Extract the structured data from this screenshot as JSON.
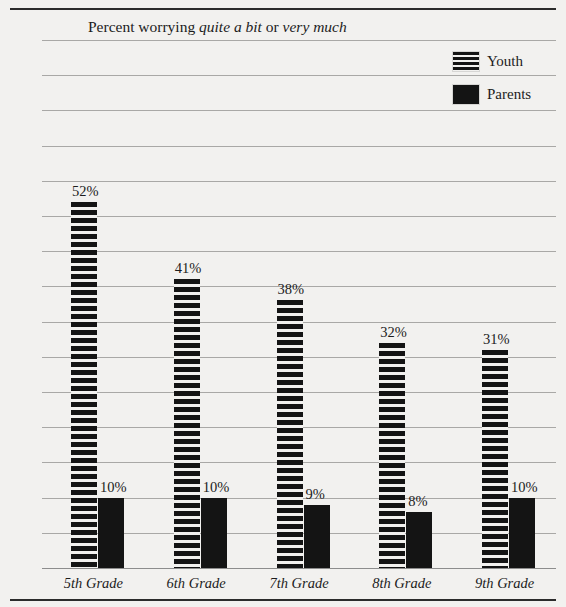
{
  "chart_data": {
    "type": "bar",
    "title": "Percent worrying quite a bit or very much",
    "title_parts": [
      {
        "text": "Percent worrying ",
        "italic": false
      },
      {
        "text": "quite a bit",
        "italic": true
      },
      {
        "text": " or ",
        "italic": false
      },
      {
        "text": "very much",
        "italic": true
      }
    ],
    "xlabel": "",
    "ylabel": "",
    "ylim": [
      0,
      75
    ],
    "grid": true,
    "legend_position": "top-right",
    "categories": [
      "5th Grade",
      "6th Grade",
      "7th Grade",
      "8th Grade",
      "9th Grade"
    ],
    "series": [
      {
        "name": "Youth",
        "values": [
          52,
          41,
          38,
          32,
          31
        ],
        "labels": [
          "52%",
          "41%",
          "38%",
          "32%",
          "31%"
        ],
        "pattern": "horizontal-stripes",
        "color": "#141414"
      },
      {
        "name": "Parents",
        "values": [
          10,
          10,
          9,
          8,
          10
        ],
        "labels": [
          "10%",
          "10%",
          "9%",
          "8%",
          "10%"
        ],
        "pattern": "solid",
        "color": "#141414"
      }
    ],
    "yticks": [
      {
        "value": 75,
        "label": "75%"
      },
      {
        "value": 70,
        "label": "70"
      },
      {
        "value": 65,
        "label": "65"
      },
      {
        "value": 60,
        "label": "60"
      },
      {
        "value": 55,
        "label": "55"
      },
      {
        "value": 50,
        "label": "50"
      },
      {
        "value": 45,
        "label": "45"
      },
      {
        "value": 40,
        "label": "40"
      },
      {
        "value": 35,
        "label": "35"
      },
      {
        "value": 30,
        "label": "30"
      },
      {
        "value": 25,
        "label": "25"
      },
      {
        "value": 20,
        "label": "20"
      },
      {
        "value": 15,
        "label": "15"
      },
      {
        "value": 10,
        "label": "10"
      },
      {
        "value": 5,
        "label": "5"
      }
    ]
  },
  "legend": {
    "items": [
      {
        "label": "Youth",
        "swatch": "striped-swatch-icon"
      },
      {
        "label": "Parents",
        "swatch": "solid-swatch-icon"
      }
    ]
  },
  "colors": {
    "background": "#f2f1ef",
    "ink": "#141414",
    "gridline": "#a9a8a6",
    "rule": "#2b2b2b"
  }
}
